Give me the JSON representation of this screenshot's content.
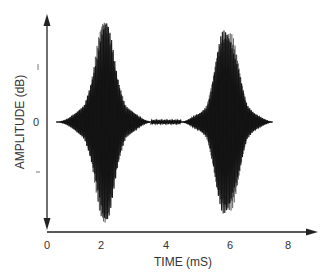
{
  "chart_data": {
    "type": "line",
    "title": "",
    "xlabel": "TIME (mS)",
    "ylabel": "AMPLITUDE (dB)",
    "x_ticks": [
      "0",
      "2",
      "4",
      "6",
      "8"
    ],
    "x_tick_values": [
      0,
      2,
      4,
      6,
      8
    ],
    "y_ticks": [
      "+",
      "0",
      "–"
    ],
    "y_tick_values": [
      1,
      0,
      -1
    ],
    "xlim": [
      0,
      8.8
    ],
    "ylim": [
      -1.9,
      1.9
    ],
    "grid": false,
    "legend": null,
    "series": [
      {
        "name": "signal",
        "bursts": [
          {
            "center_ms": 1.9,
            "start_ms": 0.3,
            "end_ms": 3.4,
            "peak_amplitude": 1.8
          },
          {
            "center_ms": 5.9,
            "start_ms": 4.4,
            "end_ms": 7.4,
            "peak_amplitude": 1.85
          }
        ],
        "baseline_segment": {
          "start_ms": 3.4,
          "end_ms": 4.4,
          "amplitude": 0.03
        }
      }
    ],
    "style": {
      "line_color": "#111111",
      "axis_color": "#222222",
      "background": "#ffffff"
    }
  }
}
